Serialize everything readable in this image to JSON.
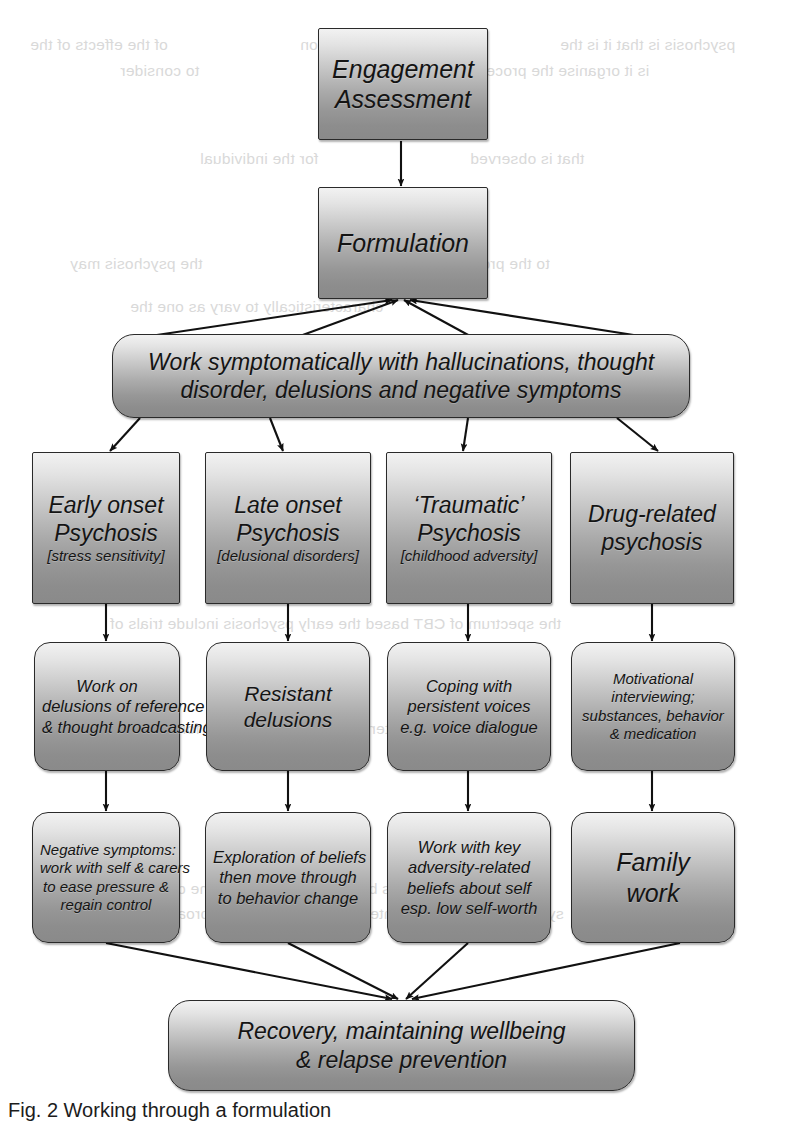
{
  "figure": {
    "caption": "Fig. 2   Working through a formulation"
  },
  "ghost_text": [
    {
      "text": "of the effects of the",
      "x": 30,
      "y": 36
    },
    {
      "text": "and early intervention",
      "x": 300,
      "y": 36
    },
    {
      "text": "psychosis is that it is the",
      "x": 560,
      "y": 36
    },
    {
      "text": "is it organise the process",
      "x": 470,
      "y": 62
    },
    {
      "text": "to consider",
      "x": 120,
      "y": 62
    },
    {
      "text": "for the individual",
      "x": 200,
      "y": 150
    },
    {
      "text": "that is observed",
      "x": 470,
      "y": 150
    },
    {
      "text": "the psychosis may",
      "x": 70,
      "y": 255
    },
    {
      "text": "to the process of",
      "x": 430,
      "y": 255
    },
    {
      "text": "characteristically to vary as one the",
      "x": 130,
      "y": 298
    },
    {
      "text": "the spectrum of CBT based the early psychosis include trials of",
      "x": 110,
      "y": 615
    },
    {
      "text": "results using the intervention should be used for everyone",
      "x": 110,
      "y": 720
    },
    {
      "text": "of the evidence that is based a formulation of the distress",
      "x": 130,
      "y": 880
    },
    {
      "text": "symptoms and their maintenance is a valuable approach",
      "x": 160,
      "y": 905
    }
  ],
  "nodes": {
    "engagement": {
      "lines": [
        "Engagement",
        "Assessment"
      ]
    },
    "formulation": {
      "lines": [
        "Formulation"
      ]
    },
    "symptomatic": {
      "lines": [
        "Work symptomatically with hallucinations, thought",
        "disorder, delusions and negative symptoms"
      ]
    },
    "type_early": {
      "lines": [
        "Early onset",
        "Psychosis"
      ],
      "sub": "[stress sensitivity]"
    },
    "type_late": {
      "lines": [
        "Late onset",
        "Psychosis"
      ],
      "sub": "[delusional disorders]"
    },
    "type_traumatic": {
      "lines": [
        "‘Traumatic’",
        "Psychosis"
      ],
      "sub": "[childhood adversity]"
    },
    "type_drug": {
      "lines": [
        "Drug-related",
        "psychosis"
      ],
      "sub": ""
    },
    "work_early": {
      "lines": [
        "Work on",
        "delusions of reference",
        "& thought broadcasting"
      ]
    },
    "work_late": {
      "lines": [
        "Resistant",
        "delusions"
      ]
    },
    "work_traumatic": {
      "lines": [
        "Coping with",
        "persistent voices",
        "e.g. voice dialogue"
      ]
    },
    "work_drug": {
      "lines": [
        "Motivational",
        "interviewing;",
        "substances, behavior",
        "& medication"
      ]
    },
    "next_early": {
      "lines": [
        "Negative symptoms:",
        "work with self & carers",
        "to ease pressure &",
        "regain control"
      ]
    },
    "next_late": {
      "lines": [
        "Exploration of beliefs",
        "then move through",
        "to behavior change"
      ]
    },
    "next_traumatic": {
      "lines": [
        "Work with key",
        "adversity-related",
        "beliefs about self",
        "esp. low self-worth"
      ]
    },
    "next_drug": {
      "lines": [
        "Family",
        "work"
      ]
    },
    "recovery": {
      "lines": [
        "Recovery, maintaining wellbeing",
        "& relapse prevention"
      ]
    }
  },
  "colors": {
    "box_border": "#2a2a2a",
    "box_fill_light": "#f2f2f2",
    "box_fill_dark": "#8a8a8a",
    "connector": "#111111",
    "text": "#141414",
    "page_background": "#ffffff"
  },
  "connectors": [
    {
      "from": "engagement",
      "to": "formulation",
      "style": "straight-arrow"
    },
    {
      "from": "formulation",
      "to": "symptomatic",
      "style": "fan-up-to-formulation"
    },
    {
      "from": "symptomatic",
      "to": "type_early",
      "style": "diagonal-arrow"
    },
    {
      "from": "symptomatic",
      "to": "type_late",
      "style": "diagonal-arrow"
    },
    {
      "from": "symptomatic",
      "to": "type_traumatic",
      "style": "diagonal-arrow"
    },
    {
      "from": "symptomatic",
      "to": "type_drug",
      "style": "diagonal-arrow"
    },
    {
      "from": "type_early",
      "to": "work_early",
      "style": "straight-arrow"
    },
    {
      "from": "type_late",
      "to": "work_late",
      "style": "straight-arrow"
    },
    {
      "from": "type_traumatic",
      "to": "work_traumatic",
      "style": "straight-arrow"
    },
    {
      "from": "type_drug",
      "to": "work_drug",
      "style": "straight-arrow"
    },
    {
      "from": "work_early",
      "to": "next_early",
      "style": "straight-arrow"
    },
    {
      "from": "work_late",
      "to": "next_late",
      "style": "straight-arrow"
    },
    {
      "from": "work_traumatic",
      "to": "next_traumatic",
      "style": "straight-arrow"
    },
    {
      "from": "work_drug",
      "to": "next_drug",
      "style": "straight-arrow"
    },
    {
      "from": "next_early",
      "to": "recovery",
      "style": "converging-arrow"
    },
    {
      "from": "next_late",
      "to": "recovery",
      "style": "converging-arrow"
    },
    {
      "from": "next_traumatic",
      "to": "recovery",
      "style": "converging-arrow"
    },
    {
      "from": "next_drug",
      "to": "recovery",
      "style": "converging-arrow"
    }
  ]
}
